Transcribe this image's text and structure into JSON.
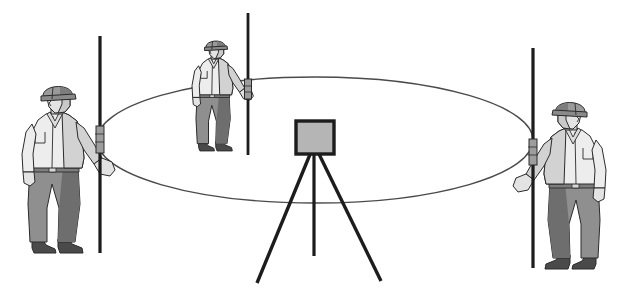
{
  "illustration": {
    "title": "Surveying crew with level instrument and three graduated rods on a circle",
    "background_color": "#ffffff",
    "outline_color": "#2b2b2b",
    "canvas": {
      "width": 628,
      "height": 296
    }
  },
  "palette": {
    "outline": "#2b2b2b",
    "rod_dark": "#1c1c1c",
    "helmet_fill": "#9a9a9a",
    "helmet_shade": "#7d7d7d",
    "face_fill": "#e3e3e3",
    "face_shade": "#c9c9c9",
    "shirt_fill": "#ededed",
    "shirt_shade": "#d2d2d2",
    "trousers_fill": "#8f8f8f",
    "trousers_shade": "#6e6e6e",
    "boot_fill": "#4a4a4a",
    "instrument_fill": "#b5b5b5",
    "instrument_stroke": "#1c1c1c",
    "ellipse_stroke": "#4a4a4a",
    "tripod_leg": "#1c1c1c"
  },
  "ellipse": {
    "label": "survey circle in perspective",
    "cx": 315,
    "cy": 140,
    "rx": 218,
    "ry": 63,
    "stroke_width": 1.4
  },
  "instrument": {
    "label": "tripod mounted surveying level",
    "head": {
      "x": 296,
      "y": 121,
      "width": 38,
      "height": 33,
      "corner_radius": 1
    },
    "apex": {
      "x": 314,
      "y": 154
    },
    "legs": [
      {
        "name": "left-leg",
        "x2": 257,
        "y2": 283
      },
      {
        "name": "center-leg",
        "x2": 314,
        "y2": 256
      },
      {
        "name": "right-leg",
        "x2": 381,
        "y2": 281
      }
    ]
  },
  "rods": [
    {
      "name": "left-rod",
      "x": 100,
      "y_top": 36,
      "y_bottom": 253,
      "width": 3.2,
      "clamp": {
        "y": 126,
        "height": 27,
        "width": 8
      }
    },
    {
      "name": "center-rod",
      "x": 248,
      "y_top": 13,
      "y_bottom": 155,
      "width": 2.8,
      "clamp": {
        "y": 79,
        "height": 20,
        "width": 7
      }
    },
    {
      "name": "right-rod",
      "x": 533,
      "y_top": 48,
      "y_bottom": 268,
      "width": 3.2,
      "clamp": {
        "y": 139,
        "height": 26,
        "width": 8
      }
    }
  ],
  "workers": [
    {
      "name": "left-worker",
      "position": "left foreground",
      "facing": "right",
      "scale": 1.0,
      "origin_x": 22,
      "origin_y": 88,
      "holds_rod": "left-rod",
      "hard_hat": true,
      "gear": [
        "hard hat",
        "long sleeve shirt",
        "trousers",
        "work boots"
      ]
    },
    {
      "name": "center-worker",
      "position": "back middle",
      "facing": "right",
      "scale": 0.66,
      "origin_x": 192,
      "origin_y": 42,
      "holds_rod": "center-rod",
      "hard_hat": true,
      "gear": [
        "hard hat",
        "long sleeve shirt",
        "trousers",
        "work boots"
      ]
    },
    {
      "name": "right-worker",
      "position": "right foreground",
      "facing": "left",
      "scale": 1.0,
      "origin_x": 606,
      "origin_y": 104,
      "holds_rod": "right-rod",
      "hard_hat": true,
      "gear": [
        "hard hat",
        "long sleeve shirt",
        "trousers",
        "work boots"
      ]
    }
  ]
}
